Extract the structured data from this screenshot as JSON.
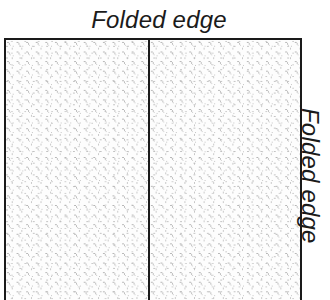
{
  "figure": {
    "name": "folded-fabric-diagram",
    "background_color": "#ffffff",
    "line_color": "#1a1a1a",
    "fill_color": "#fcfcfc",
    "texture_dot_color": "#a8a8a8",
    "text_color": "#1b1b1b",
    "top_label": "Folded edge",
    "right_label": "Folded edge",
    "panel": {
      "left_half_name": "fabric-left-half",
      "right_half_name": "fabric-right-half",
      "divider_name": "center-fold-line"
    }
  }
}
